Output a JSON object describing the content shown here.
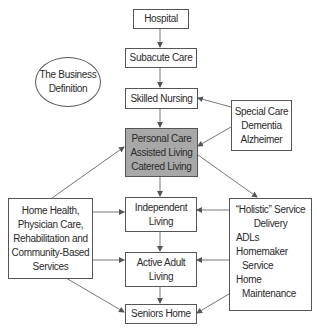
{
  "diagram": {
    "nodes": {
      "hospital": {
        "lines": [
          "Hospital"
        ]
      },
      "subacute": {
        "lines": [
          "Subacute Care"
        ]
      },
      "skilled": {
        "lines": [
          "Skilled Nursing"
        ]
      },
      "personal": {
        "lines": [
          "Personal Care",
          "Assisted Living",
          "Catered Living"
        ],
        "fill": "#a8a8a8"
      },
      "independent": {
        "lines": [
          "Independent",
          "Living"
        ]
      },
      "active": {
        "lines": [
          "Active Adult",
          "Living"
        ]
      },
      "seniors": {
        "lines": [
          "Seniors Home"
        ]
      },
      "business": {
        "lines": [
          "The Business",
          "Definition"
        ]
      },
      "special": {
        "lines": [
          "Special Care",
          "Dementia",
          "Alzheimer"
        ]
      },
      "homehealth": {
        "lines": [
          "Home Health,",
          "Physician Care,",
          "Rehabilitation and",
          "Community-Based",
          "Services"
        ]
      },
      "holistic": {
        "lines": [
          "“Holistic” Service",
          "Delivery",
          "ADLs",
          "Homemaker",
          "Service",
          "Home",
          "Maintenance"
        ]
      }
    },
    "edges": [
      {
        "from": "hospital",
        "to": "subacute"
      },
      {
        "from": "subacute",
        "to": "skilled"
      },
      {
        "from": "skilled",
        "to": "personal"
      },
      {
        "from": "personal",
        "to": "independent"
      },
      {
        "from": "independent",
        "to": "active"
      },
      {
        "from": "active",
        "to": "seniors"
      },
      {
        "from": "special",
        "to": "skilled"
      },
      {
        "from": "special",
        "to": "personal"
      },
      {
        "from": "homehealth",
        "to": "personal"
      },
      {
        "from": "homehealth",
        "to": "independent"
      },
      {
        "from": "homehealth",
        "to": "active"
      },
      {
        "from": "homehealth",
        "to": "seniors"
      },
      {
        "from": "personal",
        "to": "holistic"
      },
      {
        "from": "holistic",
        "to": "independent"
      },
      {
        "from": "holistic",
        "to": "active"
      },
      {
        "from": "holistic",
        "to": "seniors"
      }
    ]
  }
}
